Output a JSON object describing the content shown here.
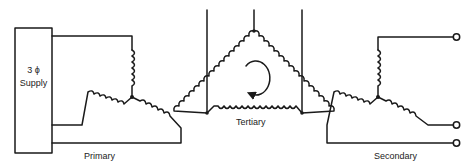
{
  "diagram": {
    "primary": {
      "label": "Primary",
      "connection": "wye",
      "source": {
        "line1": "3 ϕ",
        "line2": "Supply"
      }
    },
    "tertiary": {
      "label": "Tertiary",
      "connection": "delta",
      "annotation": "circulating-current-arrow"
    },
    "secondary": {
      "label": "Secondary",
      "connection": "wye",
      "terminals": 3
    },
    "colors": {
      "line": "#1a1a1a",
      "background": "#ffffff"
    }
  }
}
